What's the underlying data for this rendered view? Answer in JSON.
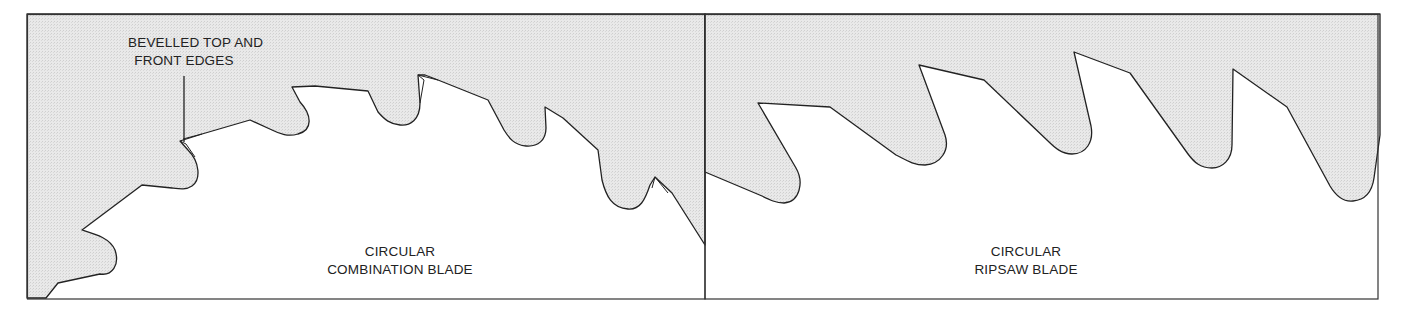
{
  "figure": {
    "panels": [
      {
        "id": "combination",
        "title_line1": "CIRCULAR",
        "title_line2": "COMBINATION BLADE",
        "callout_line1": "BEVELLED TOP AND",
        "callout_line2": "FRONT EDGES"
      },
      {
        "id": "ripsaw",
        "title_line1": "CIRCULAR",
        "title_line2": "RIPSAW BLADE"
      }
    ],
    "colors": {
      "blade_fill": "#e6e6e6",
      "outline": "#222222",
      "background": "#ffffff"
    }
  }
}
